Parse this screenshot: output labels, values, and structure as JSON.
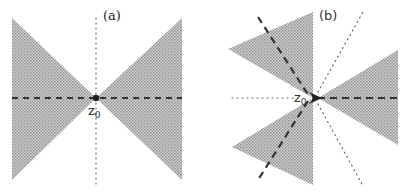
{
  "figure": {
    "panels": [
      {
        "id": "a",
        "label": "(a)",
        "point_label": "z",
        "point_subscript": "0",
        "center": [
          96,
          98
        ],
        "shaded_wedges": [
          {
            "points": [
              [
                12,
                18
              ],
              [
                96,
                98
              ],
              [
                12,
                180
              ]
            ]
          },
          {
            "points": [
              [
                182,
                18
              ],
              [
                96,
                98
              ],
              [
                182,
                180
              ]
            ]
          }
        ],
        "dashed_lines": [
          {
            "from": [
              12,
              98
            ],
            "to": [
              182,
              98
            ]
          }
        ],
        "dotted_lines": [
          {
            "from": [
              96,
              18
            ],
            "to": [
              96,
              186
            ]
          }
        ]
      },
      {
        "id": "b",
        "label": "(b)",
        "point_label": "z",
        "point_subscript": "0",
        "center": [
          313,
          98
        ],
        "shaded_wedges": [
          {
            "points": [
              [
                228,
                49
              ],
              [
                313,
                12
              ],
              [
                313,
                98
              ]
            ]
          },
          {
            "points": [
              [
                232,
                147
              ],
              [
                313,
                98
              ],
              [
                313,
                185
              ]
            ]
          },
          {
            "points": [
              [
                398,
                50
              ],
              [
                318,
                98
              ],
              [
                398,
                145
              ]
            ]
          }
        ],
        "dashed_lines": [
          {
            "from": [
              258,
              17
            ],
            "to": [
              309,
              98
            ]
          },
          {
            "from": [
              309,
              98
            ],
            "to": [
              258,
              180
            ]
          },
          {
            "from": [
              318,
              98
            ],
            "to": [
              398,
              98
            ]
          }
        ],
        "dotted_lines": [
          {
            "from": [
              232,
              98
            ],
            "to": [
              300,
              98
            ]
          },
          {
            "from": [
              318,
              94
            ],
            "to": [
              363,
              12
            ]
          },
          {
            "from": [
              318,
              102
            ],
            "to": [
              363,
              186
            ]
          }
        ]
      }
    ],
    "colors": {
      "shade": "#bdbdbd",
      "line": "#333333",
      "dot": "#666666"
    }
  }
}
